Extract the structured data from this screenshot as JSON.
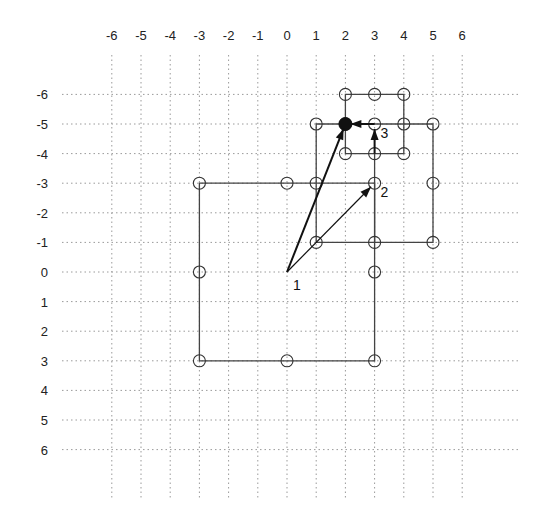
{
  "diagram": {
    "title": "",
    "x_ticks": [
      "-6",
      "-5",
      "-4",
      "-3",
      "-2",
      "-1",
      "0",
      "1",
      "2",
      "3",
      "4",
      "5",
      "6"
    ],
    "y_ticks": [
      "-6",
      "-5",
      "-4",
      "-3",
      "-2",
      "-1",
      "0",
      "1",
      "2",
      "3",
      "4",
      "5",
      "6"
    ],
    "layout": {
      "x0": 287,
      "y0": 272,
      "dx": 29.2,
      "dy": 29.6
    },
    "squares": [
      {
        "name": "large-square",
        "corners": [
          [
            -3,
            -3
          ],
          [
            3,
            -3
          ],
          [
            3,
            3
          ],
          [
            -3,
            3
          ]
        ],
        "nodes": [
          [
            -3,
            -3
          ],
          [
            0,
            -3
          ],
          [
            3,
            -3
          ],
          [
            3,
            0
          ],
          [
            3,
            3
          ],
          [
            0,
            3
          ],
          [
            -3,
            3
          ],
          [
            -3,
            0
          ]
        ]
      },
      {
        "name": "medium-square",
        "corners": [
          [
            1,
            -5
          ],
          [
            5,
            -5
          ],
          [
            5,
            -1
          ],
          [
            1,
            -1
          ]
        ],
        "nodes": [
          [
            1,
            -5
          ],
          [
            3,
            -5
          ],
          [
            5,
            -5
          ],
          [
            5,
            -3
          ],
          [
            5,
            -1
          ],
          [
            3,
            -1
          ],
          [
            1,
            -1
          ],
          [
            1,
            -3
          ]
        ]
      },
      {
        "name": "small-square",
        "corners": [
          [
            2,
            -6
          ],
          [
            4,
            -6
          ],
          [
            4,
            -4
          ],
          [
            2,
            -4
          ]
        ],
        "nodes": [
          [
            2,
            -6
          ],
          [
            3,
            -6
          ],
          [
            4,
            -6
          ],
          [
            4,
            -5
          ],
          [
            4,
            -4
          ],
          [
            3,
            -4
          ],
          [
            2,
            -4
          ],
          [
            2,
            -5
          ]
        ]
      }
    ],
    "filled_node": [
      2,
      -5
    ],
    "arrows": [
      {
        "name": "arrow-1",
        "from": [
          0,
          0
        ],
        "to": [
          2,
          -5
        ],
        "weight": "thick"
      },
      {
        "name": "arrow-2",
        "from": [
          0,
          0
        ],
        "to": [
          3,
          -3
        ],
        "weight": "thin"
      },
      {
        "name": "arrow-3",
        "from": [
          3,
          -4
        ],
        "to": [
          3,
          -5
        ],
        "weight": "thick"
      },
      {
        "name": "arrow-4",
        "from": [
          3,
          -5
        ],
        "to": [
          2,
          -5
        ],
        "weight": "thick"
      }
    ],
    "labels": [
      {
        "text": "1",
        "at": [
          0,
          0
        ],
        "offset": [
          6,
          18
        ]
      },
      {
        "text": "2",
        "at": [
          3,
          -3
        ],
        "offset": [
          6,
          14
        ]
      },
      {
        "text": "3",
        "at": [
          3,
          -5
        ],
        "offset": [
          6,
          14
        ]
      }
    ]
  }
}
